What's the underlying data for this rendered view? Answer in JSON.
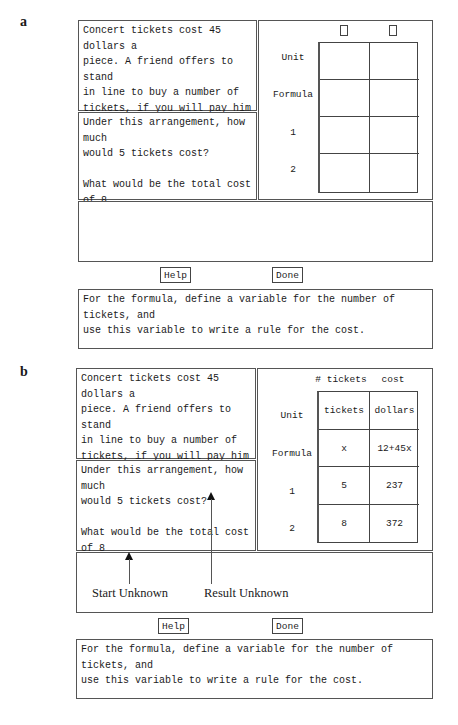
{
  "panels": [
    {
      "label": "a",
      "problem_text": "Concert tickets cost 45 dollars a\npiece. A friend offers to stand\nin line to buy a number of\ntickets, if you will pay him a\nfee of 12 dollars to do so.",
      "questions_text": "Under this arrangement, how much\nwould 5 tickets cost?\n\nWhat would be the total cost of 8\ntickets?",
      "table": {
        "column_headers": [
          "",
          ""
        ],
        "row_labels": [
          "Unit",
          "Formula",
          "1",
          "2"
        ],
        "rows": [
          [
            "",
            ""
          ],
          [
            "",
            ""
          ],
          [
            "",
            ""
          ],
          [
            "",
            ""
          ]
        ]
      },
      "help_label": "Help",
      "done_label": "Done",
      "hint_text": "For the formula, define a variable for the number of tickets, and\nuse this variable to write a rule for the cost."
    },
    {
      "label": "b",
      "problem_text": "Concert tickets cost 45 dollars a\npiece. A friend offers to stand\nin line to buy a number of\ntickets, if you will pay him a\nfee of 12 dollars to do so.",
      "questions_text": "Under this arrangement, how much\nwould 5 tickets cost?\n\nWhat would be the total cost of 8\ntickets?",
      "table": {
        "column_headers": [
          "# tickets",
          "cost"
        ],
        "row_labels": [
          "Unit",
          "Formula",
          "1",
          "2"
        ],
        "rows": [
          [
            "tickets",
            "dollars"
          ],
          [
            "x",
            "12+45x"
          ],
          [
            "5",
            "237"
          ],
          [
            "8",
            "372"
          ]
        ]
      },
      "annotations": {
        "start_unknown": "Start Unknown",
        "result_unknown": "Result Unknown"
      },
      "help_label": "Help",
      "done_label": "Done",
      "hint_text": "For the formula, define a variable for the number of tickets, and\nuse this variable to write a rule for the cost."
    }
  ]
}
